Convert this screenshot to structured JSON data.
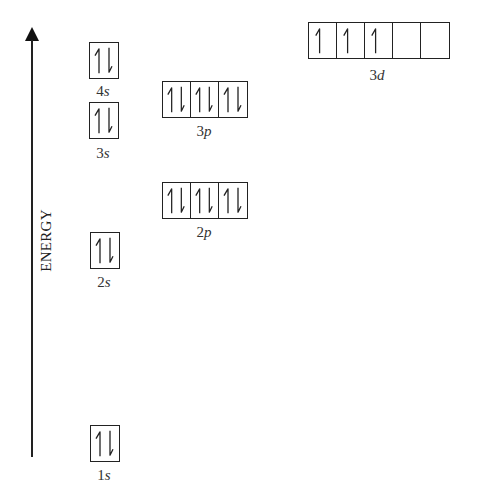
{
  "diagram": {
    "axis_label": "ENERGY",
    "axis_direction": "up",
    "orbitals": [
      {
        "id": "1s",
        "n": "1",
        "l": "s",
        "boxes": 1,
        "electrons": [
          "updown"
        ]
      },
      {
        "id": "2s",
        "n": "2",
        "l": "s",
        "boxes": 1,
        "electrons": [
          "updown"
        ]
      },
      {
        "id": "2p",
        "n": "2",
        "l": "p",
        "boxes": 3,
        "electrons": [
          "updown",
          "updown",
          "updown"
        ]
      },
      {
        "id": "3s",
        "n": "3",
        "l": "s",
        "boxes": 1,
        "electrons": [
          "updown"
        ]
      },
      {
        "id": "3p",
        "n": "3",
        "l": "p",
        "boxes": 3,
        "electrons": [
          "updown",
          "updown",
          "updown"
        ]
      },
      {
        "id": "4s",
        "n": "4",
        "l": "s",
        "boxes": 1,
        "electrons": [
          "updown"
        ]
      },
      {
        "id": "3d",
        "n": "3",
        "l": "d",
        "boxes": 5,
        "electrons": [
          "up",
          "up",
          "up",
          "empty",
          "empty"
        ]
      }
    ],
    "labels": {
      "1s": {
        "n": "1",
        "l": "s"
      },
      "2s": {
        "n": "2",
        "l": "s"
      },
      "2p": {
        "n": "2",
        "l": "p"
      },
      "3s": {
        "n": "3",
        "l": "s"
      },
      "3p": {
        "n": "3",
        "l": "p"
      },
      "4s": {
        "n": "4",
        "l": "s"
      },
      "3d": {
        "n": "3",
        "l": "d"
      }
    },
    "colors": {
      "ink": "#222222",
      "background": "#ffffff"
    }
  }
}
